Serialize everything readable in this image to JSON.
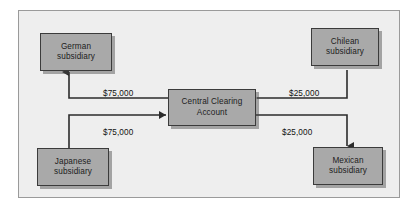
{
  "diagram": {
    "background_color": "#eeeeee",
    "node_fill_color": "#a9a9a9",
    "node_border_color": "#3b3b3b",
    "edge_color": "#2b2b2b",
    "nodes": [
      {
        "id": "german",
        "line1": "German",
        "line2": "subsidiary"
      },
      {
        "id": "chilean",
        "line1": "Chilean",
        "line2": "subsidiary"
      },
      {
        "id": "central",
        "line1": "Central Clearing",
        "line2": "Account"
      },
      {
        "id": "japanese",
        "line1": "Japanese",
        "line2": "subsidiary"
      },
      {
        "id": "mexican",
        "line1": "Mexican",
        "line2": "subsidiary"
      }
    ],
    "edges": [
      {
        "id": "central-to-german",
        "from": "central",
        "to": "german",
        "amount": "$75,000"
      },
      {
        "id": "japanese-to-central",
        "from": "japanese",
        "to": "central",
        "amount": "$75,000"
      },
      {
        "id": "chilean-to-central",
        "from": "chilean",
        "to": "central",
        "amount": "$25,000"
      },
      {
        "id": "central-to-mexican",
        "from": "central",
        "to": "mexican",
        "amount": "$25,000"
      }
    ]
  }
}
